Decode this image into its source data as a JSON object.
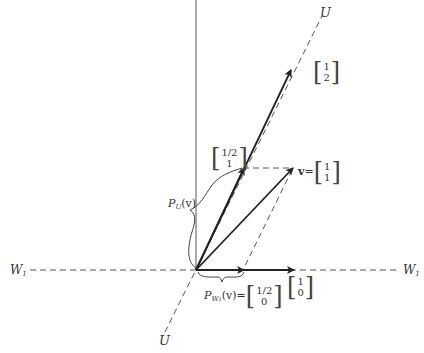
{
  "diagram": {
    "axis_labels": {
      "u_top": "U",
      "u_bottom": "U",
      "w1_left": "W",
      "w1_left_sub": "1",
      "w1_right": "W",
      "w1_right_sub": "1"
    },
    "vectors": {
      "e12": {
        "top": "1",
        "bottom": "2"
      },
      "pu": {
        "top": "1/2",
        "bottom": "1"
      },
      "v": {
        "name": "v",
        "eq": "=",
        "top": "1",
        "bottom": "1"
      },
      "e10": {
        "top": "1",
        "bottom": "0"
      },
      "pw": {
        "name_p": "P",
        "name_sub": "W",
        "name_subsub": "1",
        "arg": "(v)",
        "eq": "=",
        "top": "1/2",
        "bottom": "0"
      }
    },
    "braces": {
      "pu_label_p": "P",
      "pu_label_sub": "U",
      "pu_label_arg": "(v)"
    },
    "colors": {
      "line": "#333333",
      "dashed": "#555555",
      "background": "#ffffff"
    }
  }
}
